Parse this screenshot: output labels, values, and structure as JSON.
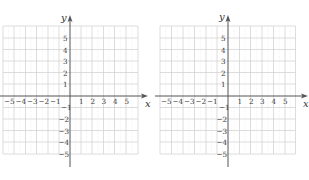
{
  "figure": {
    "graphs": [
      {
        "id": "left",
        "x_axis_label": "x",
        "y_axis_label": "y",
        "x_ticks": [
          "−5",
          "−4",
          "−3",
          "−2",
          "−1",
          "1",
          "2",
          "3",
          "4",
          "5"
        ],
        "y_ticks_positive": [
          "5",
          "4",
          "3",
          "2",
          "1"
        ],
        "y_ticks_negative": [
          "−1",
          "−2",
          "−3",
          "−4",
          "−5"
        ]
      },
      {
        "id": "right",
        "x_axis_label": "x",
        "y_axis_label": "y",
        "x_ticks": [
          "−5",
          "−4",
          "−3",
          "−2",
          "−1",
          "1",
          "2",
          "3",
          "4",
          "5"
        ],
        "y_ticks_positive": [
          "5",
          "4",
          "3",
          "2",
          "1"
        ],
        "y_ticks_negative": [
          "−1",
          "−2",
          "−3",
          "−4",
          "−5"
        ]
      }
    ],
    "colors": {
      "grid": "#c8c8c8",
      "grid_dotted": "#d9d9d9",
      "axis": "#555555",
      "text": "#3a3a3a"
    }
  }
}
